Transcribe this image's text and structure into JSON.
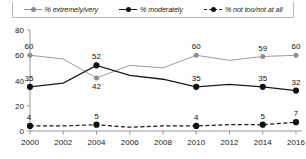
{
  "legend": {
    "items": [
      {
        "label": "% extremely/very",
        "marker": "solid-gray-dot",
        "color": "#9d9d9d"
      },
      {
        "label": "% moderately",
        "marker": "solid-black-dot",
        "color": "#1a1a1a"
      },
      {
        "label": "% not too/not at all",
        "marker": "dashed-black-dot",
        "color": "#1a1a1a"
      }
    ]
  },
  "axes": {
    "y_ticks": [
      "0",
      "20",
      "40",
      "60",
      "80"
    ],
    "x_ticks": [
      "2000",
      "2002",
      "2004",
      "2006",
      "2008",
      "2010",
      "2012",
      "2014",
      "2016"
    ]
  },
  "chart_data": {
    "type": "line",
    "title": "",
    "subtitle": "",
    "xlabel": "",
    "ylabel": "",
    "ylim": [
      0,
      80
    ],
    "xlim": [
      2000,
      2016
    ],
    "grid": false,
    "legend_position": "top",
    "x": [
      2000,
      2002,
      2004,
      2006,
      2008,
      2010,
      2012,
      2014,
      2016
    ],
    "series": [
      {
        "name": "% extremely/very",
        "color": "#9d9d9d",
        "style": "solid",
        "values": [
          60,
          57,
          42,
          52,
          50,
          60,
          56,
          59,
          60
        ],
        "labeled_points": [
          {
            "x": 2000,
            "value": 60
          },
          {
            "x": 2004,
            "value": 42
          },
          {
            "x": 2010,
            "value": 60
          },
          {
            "x": 2014,
            "value": 59
          },
          {
            "x": 2016,
            "value": 60
          }
        ]
      },
      {
        "name": "% moderately",
        "color": "#1a1a1a",
        "style": "solid",
        "values": [
          35,
          38,
          52,
          44,
          41,
          35,
          37,
          35,
          32
        ],
        "labeled_points": [
          {
            "x": 2000,
            "value": 35
          },
          {
            "x": 2004,
            "value": 52
          },
          {
            "x": 2010,
            "value": 35
          },
          {
            "x": 2014,
            "value": 35
          },
          {
            "x": 2016,
            "value": 32
          }
        ]
      },
      {
        "name": "% not too/not at all",
        "color": "#1a1a1a",
        "style": "dashed",
        "values": [
          4,
          4,
          5,
          3,
          4,
          4,
          5,
          5,
          7
        ],
        "labeled_points": [
          {
            "x": 2000,
            "value": 4
          },
          {
            "x": 2004,
            "value": 5
          },
          {
            "x": 2010,
            "value": 4
          },
          {
            "x": 2014,
            "value": 5
          },
          {
            "x": 2016,
            "value": 7
          }
        ]
      }
    ]
  }
}
